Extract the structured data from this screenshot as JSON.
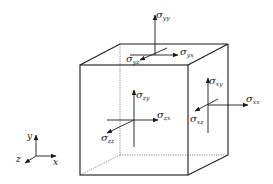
{
  "diagram": {
    "colors": {
      "line": "#1a1a1a",
      "text": "#222222",
      "background": "#ffffff"
    },
    "axes": {
      "x_label": "x",
      "y_label": "y",
      "z_label": "z"
    },
    "labels": {
      "top_normal": {
        "symbol": "σ",
        "sub": "yy"
      },
      "top_shear_x": {
        "symbol": "σ",
        "sub": "yx"
      },
      "top_shear_z": {
        "symbol": "σ",
        "sub": "yz"
      },
      "front_shear_y": {
        "symbol": "σ",
        "sub": "zy"
      },
      "front_shear_x": {
        "symbol": "σ",
        "sub": "zx"
      },
      "front_normal": {
        "symbol": "σ",
        "sub": "zz"
      },
      "right_shear_y": {
        "symbol": "σ",
        "sub": "xy"
      },
      "right_normal": {
        "symbol": "σ",
        "sub": "xx"
      },
      "right_shear_z": {
        "symbol": "σ",
        "sub": "xz"
      }
    }
  }
}
